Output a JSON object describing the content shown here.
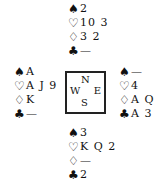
{
  "suits": {
    "spades": "♠",
    "hearts": "♡",
    "diamonds": "♢",
    "clubs": "♣"
  },
  "compass": {
    "north": "N",
    "west": "W",
    "east": "E",
    "south": "S"
  },
  "hands": {
    "north": {
      "spades": "2",
      "hearts": "10 3",
      "diamonds": "3 2",
      "clubs": "—"
    },
    "west": {
      "spades": "A",
      "hearts": "A J 9",
      "diamonds": "K",
      "clubs": "—"
    },
    "east": {
      "spades": "—",
      "hearts": "4",
      "diamonds": "A Q",
      "clubs": "A 3"
    },
    "south": {
      "spades": "3",
      "hearts": "K Q 2",
      "diamonds": "—",
      "clubs": "2"
    }
  }
}
